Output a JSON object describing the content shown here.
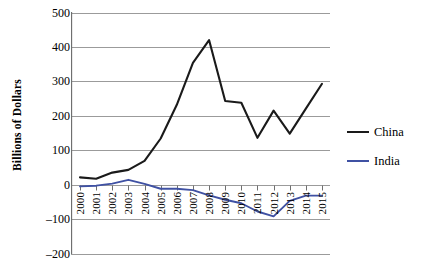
{
  "chart_data": {
    "type": "line",
    "title": "",
    "xlabel": "",
    "ylabel": "Billions of Dollars",
    "ylim": [
      -200,
      500
    ],
    "ytick_values": [
      500,
      400,
      300,
      200,
      100,
      0,
      -100,
      -200
    ],
    "ytick_labels": [
      "500",
      "400",
      "300",
      "200",
      "100",
      "0",
      "–100",
      "–200"
    ],
    "grid": true,
    "legend_position": "right",
    "categories": [
      "2000",
      "2001",
      "2002",
      "2003",
      "2004",
      "2005",
      "2006",
      "2007",
      "2008",
      "2009",
      "2010",
      "2011",
      "2012",
      "2013",
      "2014",
      "2015"
    ],
    "series": [
      {
        "name": "China",
        "color": "#1a1a1a",
        "values": [
          21,
          17,
          35,
          43,
          69,
          134,
          232,
          354,
          420,
          243,
          238,
          136,
          215,
          148,
          221,
          293
        ]
      },
      {
        "name": "India",
        "color": "#3f51a3",
        "values": [
          -5,
          -3,
          3,
          14,
          2,
          -12,
          -12,
          -16,
          -31,
          -44,
          -54,
          -78,
          -92,
          -47,
          -32,
          -32
        ]
      }
    ]
  },
  "legend": {
    "items": [
      {
        "label": "China",
        "color": "#1a1a1a"
      },
      {
        "label": "India",
        "color": "#3f51a3"
      }
    ]
  },
  "axes": {
    "y_title": "Billions of Dollars"
  },
  "colors": {
    "grid": "#9b9b9b",
    "axis": "#6f6f6f",
    "background": "#ffffff"
  }
}
